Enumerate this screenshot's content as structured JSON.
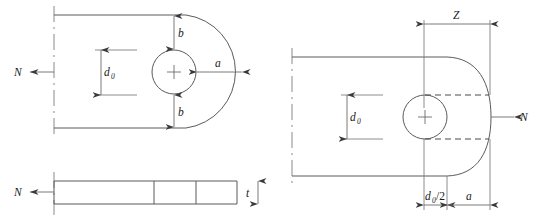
{
  "figure": {
    "background_color": "#ffffff",
    "line_color": "#5a5a5a",
    "text_color": "#1a1a1a",
    "width": 542,
    "height": 221
  },
  "left_view": {
    "name": "plan-and-section-view",
    "force_label_top": "N",
    "force_label_section": "N",
    "hole_diameter_label": "d",
    "hole_diameter_sub": "0",
    "edge_distance_top_label": "b",
    "edge_distance_bottom_label": "b",
    "end_distance_label": "a",
    "thickness_label": "t"
  },
  "right_view": {
    "name": "alternative-lug-view",
    "force_label": "N",
    "hole_diameter_label": "d",
    "hole_diameter_sub": "0",
    "z_dimension_label": "Z",
    "half_hole_label": "d",
    "half_hole_sub": "0",
    "half_hole_suffix": "/2",
    "end_distance_label": "a"
  }
}
